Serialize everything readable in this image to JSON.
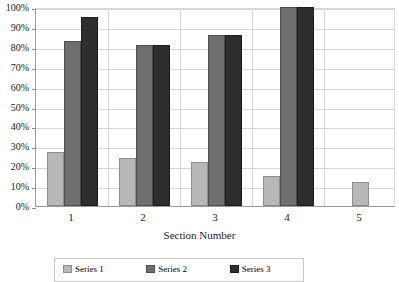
{
  "chart_data": {
    "type": "bar",
    "title": "",
    "subtitle": "",
    "xlabel": "Section Number",
    "ylabel": "",
    "categories": [
      "1",
      "2",
      "3",
      "4",
      "5"
    ],
    "series": [
      {
        "name": "Series 1",
        "color": "#b8b8b8",
        "values": [
          27,
          24,
          22,
          15,
          12
        ]
      },
      {
        "name": "Series 2",
        "color": "#6e6e6e",
        "values": [
          83,
          81,
          86,
          100,
          null
        ]
      },
      {
        "name": "Series 3",
        "color": "#2e2e2e",
        "values": [
          95,
          81,
          86,
          100,
          null
        ]
      }
    ],
    "ylim": [
      0,
      100
    ],
    "y_ticks": [
      "0%",
      "10%",
      "20%",
      "30%",
      "40%",
      "50%",
      "60%",
      "70%",
      "80%",
      "90%",
      "100%"
    ],
    "y_tick_values": [
      0,
      10,
      20,
      30,
      40,
      50,
      60,
      70,
      80,
      90,
      100
    ],
    "y_unit": "%",
    "grid": "horizontal-and-vertical",
    "legend_position": "bottom",
    "legend_visible": true,
    "legend_clipped": true
  },
  "colors": {
    "series_light": "#b8b8b8",
    "series_medium": "#6e6e6e",
    "series_dark": "#2e2e2e",
    "gridline": "#d6d6d6",
    "axis": "#9a9a9a",
    "plot_background": "#ffffff",
    "text": "#1a1a1a"
  }
}
